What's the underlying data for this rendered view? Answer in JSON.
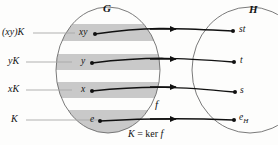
{
  "diagram": {
    "title_left": "G",
    "title_right": "H",
    "map_label": "f",
    "kernel_note": "K = ker f",
    "kernel_note_parts": {
      "lhs": "K",
      "eq": "=",
      "rhs": "ker",
      "arg": "f"
    },
    "domain_sets": {
      "name": "G",
      "shape": "ellipse",
      "cosets": [
        {
          "id": "coset-xy",
          "label": "(xy)K",
          "element": "xy",
          "shaded": true
        },
        {
          "id": "coset-y",
          "label": "yK",
          "element": "y",
          "shaded": true
        },
        {
          "id": "coset-x",
          "label": "xK",
          "element": "x",
          "shaded": true
        },
        {
          "id": "coset-k",
          "label": "K",
          "element": "e",
          "shaded": true
        }
      ]
    },
    "codomain_set": {
      "name": "H",
      "shape": "ellipse",
      "elements": [
        {
          "id": "elem-st",
          "label": "st",
          "sub": ""
        },
        {
          "id": "elem-t",
          "label": "t",
          "sub": ""
        },
        {
          "id": "elem-s",
          "label": "s",
          "sub": ""
        },
        {
          "id": "elem-eh",
          "label": "e",
          "sub": "H"
        }
      ]
    },
    "arrows": [
      {
        "from": "xy",
        "to": "st"
      },
      {
        "from": "y",
        "to": "t"
      },
      {
        "from": "x",
        "to": "s"
      },
      {
        "from": "e",
        "to": "eH"
      }
    ],
    "colors": {
      "stroke": "#3c3c3c",
      "shade": "#c9c9c9",
      "arrow": "#111111",
      "text": "#141414",
      "background": "#fdfdfc",
      "leader": "#a8a8a8"
    }
  }
}
